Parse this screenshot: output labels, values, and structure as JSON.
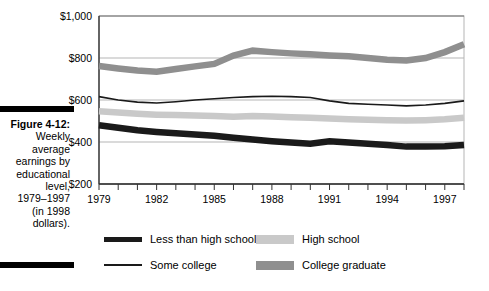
{
  "figure": {
    "label": "Figure 4-12:",
    "caption_lines": [
      "Weekly",
      "average",
      "earnings by",
      "educational",
      "level,",
      "1979–1997",
      "(in 1998",
      "dollars)."
    ]
  },
  "legend": {
    "entries": [
      {
        "label": "Less than high school",
        "swatch": "thick-dark-line",
        "color": "#1a1a1a"
      },
      {
        "label": "High school",
        "swatch": "light-gray-band",
        "color": "#c9c9c9"
      },
      {
        "label": "Some college",
        "swatch": "thin-dark-line",
        "color": "#1a1a1a"
      },
      {
        "label": "College graduate",
        "swatch": "medium-gray-band",
        "color": "#8f8f8f"
      }
    ]
  },
  "chart_data": {
    "type": "line",
    "title": "",
    "xlabel": "",
    "ylabel": "",
    "xlim": [
      1979,
      1998
    ],
    "ylim": [
      200,
      1000
    ],
    "grid": true,
    "legend_position": "below",
    "y_ticks": [
      200,
      400,
      600,
      800,
      1000
    ],
    "y_tick_labels": [
      "$200",
      "$400",
      "$600",
      "$800",
      "$1,000"
    ],
    "x_ticks": [
      1979,
      1980,
      1981,
      1982,
      1983,
      1984,
      1985,
      1986,
      1987,
      1988,
      1989,
      1990,
      1991,
      1992,
      1993,
      1994,
      1995,
      1996,
      1997,
      1998
    ],
    "x_tick_labels_shown": [
      "1979",
      "1982",
      "1985",
      "1988",
      "1991",
      "1994",
      "1997"
    ],
    "x": [
      1979,
      1980,
      1981,
      1982,
      1983,
      1984,
      1985,
      1986,
      1987,
      1988,
      1989,
      1990,
      1991,
      1992,
      1993,
      1994,
      1995,
      1996,
      1997,
      1998
    ],
    "series": [
      {
        "name": "College graduate",
        "color": "#8f8f8f",
        "width": "thick",
        "values": [
          762,
          750,
          740,
          735,
          748,
          760,
          772,
          812,
          835,
          828,
          822,
          818,
          812,
          808,
          800,
          792,
          788,
          800,
          828,
          865
        ]
      },
      {
        "name": "Some college",
        "color": "#1a1a1a",
        "width": "thin",
        "values": [
          616,
          600,
          590,
          586,
          592,
          600,
          606,
          612,
          616,
          618,
          616,
          612,
          596,
          584,
          580,
          576,
          572,
          576,
          584,
          596
        ]
      },
      {
        "name": "High school",
        "color": "#c9c9c9",
        "width": "thick",
        "values": [
          546,
          540,
          534,
          530,
          528,
          526,
          524,
          520,
          524,
          522,
          518,
          516,
          512,
          508,
          506,
          504,
          502,
          504,
          508,
          516
        ]
      },
      {
        "name": "Less than high school",
        "color": "#1a1a1a",
        "width": "thick",
        "values": [
          480,
          468,
          456,
          448,
          442,
          436,
          430,
          420,
          412,
          404,
          398,
          392,
          404,
          398,
          392,
          386,
          378,
          378,
          380,
          386
        ]
      }
    ]
  }
}
